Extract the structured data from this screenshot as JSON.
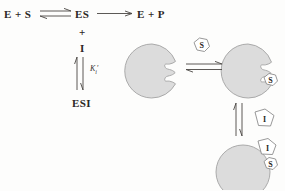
{
  "figure": {
    "background_color": "#fdfdfc",
    "enzyme_fill": "#dcdcdc",
    "enzyme_stroke": "#9a9a9a",
    "ink_color": "#2b2724"
  },
  "scheme": {
    "reactant_label": "E + S",
    "complex_label": "ES",
    "product_label": "E + P",
    "plus_sign": "+",
    "inhibitor_label": "I",
    "ternary_label": "ESI",
    "constant_label": "K",
    "constant_subscript": "i",
    "constant_prime": "′",
    "arrows": [
      {
        "name": "es-formation",
        "type": "equilibrium",
        "orientation": "horizontal"
      },
      {
        "name": "product-release",
        "type": "single",
        "orientation": "horizontal"
      },
      {
        "name": "esi-equilibrium",
        "type": "equilibrium",
        "orientation": "vertical"
      }
    ]
  },
  "cartoon": {
    "substrate_symbol": "S",
    "inhibitor_symbol": "I",
    "substrate_shape": "hexagon",
    "inhibitor_shape": "pentagon",
    "enzymes": [
      {
        "name": "free-enzyme",
        "bound": []
      },
      {
        "name": "es-complex",
        "bound": [
          "S"
        ]
      },
      {
        "name": "esi-complex",
        "bound": [
          "I",
          "S"
        ]
      }
    ],
    "arrows": [
      {
        "name": "substrate-binding",
        "type": "equilibrium",
        "orientation": "horizontal"
      },
      {
        "name": "inhibitor-binding",
        "type": "equilibrium",
        "orientation": "vertical"
      }
    ]
  }
}
